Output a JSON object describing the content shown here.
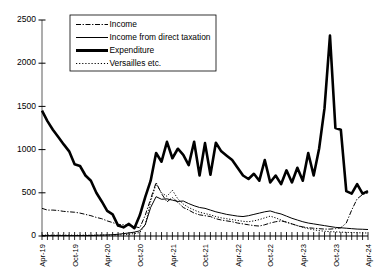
{
  "chart_data": {
    "type": "line",
    "title": "",
    "xlabel": "",
    "ylabel": "",
    "ylim": [
      0,
      2500
    ],
    "yticks": [
      0,
      500,
      1000,
      1500,
      2000,
      2500
    ],
    "ytick_labels": [
      "0",
      "500",
      "1000",
      "1500",
      "2000",
      "2500"
    ],
    "grid": false,
    "legend_position": "top-center",
    "x_axis_tick_count": 61,
    "x_label_interval": 6,
    "xtick_labels": [
      "Apr-19",
      "Oct-19",
      "Apr-20",
      "Oct-20",
      "Apr-21",
      "Oct-21",
      "Apr-22",
      "Oct-22",
      "Apr-23",
      "Oct-23",
      "Apr-24"
    ],
    "x": [
      "Apr-19",
      "May-19",
      "Jun-19",
      "Jul-19",
      "Aug-19",
      "Sep-19",
      "Oct-19",
      "Nov-19",
      "Dec-19",
      "Jan-20",
      "Feb-20",
      "Mar-20",
      "Apr-20",
      "May-20",
      "Jun-20",
      "Jul-20",
      "Aug-20",
      "Sep-20",
      "Oct-20",
      "Nov-20",
      "Dec-20",
      "Jan-21",
      "Feb-21",
      "Mar-21",
      "Apr-21",
      "May-21",
      "Jun-21",
      "Jul-21",
      "Aug-21",
      "Sep-21",
      "Oct-21",
      "Nov-21",
      "Dec-21",
      "Jan-22",
      "Feb-22",
      "Mar-22",
      "Apr-22",
      "May-22",
      "Jun-22",
      "Jul-22",
      "Aug-22",
      "Sep-22",
      "Oct-22",
      "Nov-22",
      "Dec-22",
      "Jan-23",
      "Feb-23",
      "Mar-23",
      "Apr-23",
      "May-23",
      "Jun-23",
      "Jul-23",
      "Aug-23",
      "Sep-23",
      "Oct-23",
      "Nov-23",
      "Dec-23",
      "Jan-24",
      "Feb-24",
      "Mar-24",
      "Apr-24"
    ],
    "series": [
      {
        "name": "Income",
        "style": "dash-dot",
        "color": "#000000",
        "values": [
          320,
          300,
          300,
          295,
          285,
          280,
          275,
          265,
          250,
          235,
          215,
          200,
          175,
          155,
          135,
          130,
          120,
          110,
          95,
          240,
          430,
          620,
          490,
          395,
          445,
          390,
          330,
          300,
          265,
          245,
          235,
          225,
          200,
          185,
          175,
          165,
          150,
          140,
          130,
          120,
          115,
          130,
          150,
          165,
          175,
          160,
          140,
          120,
          105,
          95,
          90,
          85,
          80,
          80,
          85,
          95,
          150,
          300,
          430,
          480,
          500
        ]
      },
      {
        "name": "Income from direct taxation",
        "style": "solid-thin",
        "color": "#000000",
        "values": [
          5,
          5,
          5,
          5,
          5,
          5,
          5,
          5,
          5,
          5,
          8,
          10,
          12,
          15,
          20,
          28,
          35,
          45,
          60,
          130,
          330,
          455,
          425,
          430,
          415,
          400,
          405,
          375,
          350,
          330,
          320,
          300,
          280,
          265,
          250,
          240,
          230,
          225,
          235,
          250,
          265,
          280,
          290,
          270,
          255,
          230,
          205,
          185,
          165,
          150,
          140,
          130,
          120,
          110,
          100,
          95,
          90,
          85,
          80,
          78,
          75
        ]
      },
      {
        "name": "Expenditure",
        "style": "solid-thick",
        "color": "#000000",
        "values": [
          1450,
          1330,
          1230,
          1145,
          1060,
          980,
          830,
          810,
          700,
          640,
          500,
          400,
          290,
          250,
          120,
          100,
          140,
          90,
          240,
          450,
          640,
          960,
          860,
          1090,
          900,
          1010,
          940,
          820,
          1090,
          700,
          1075,
          710,
          1080,
          980,
          930,
          880,
          790,
          700,
          660,
          720,
          640,
          880,
          620,
          700,
          600,
          760,
          620,
          790,
          640,
          960,
          700,
          1010,
          1480,
          2320,
          1250,
          1230,
          520,
          490,
          600,
          490,
          520
        ]
      },
      {
        "name": "Versailles etc.",
        "style": "dotted",
        "color": "#000000",
        "values": [
          10,
          10,
          10,
          10,
          10,
          10,
          10,
          10,
          10,
          10,
          10,
          10,
          10,
          10,
          12,
          15,
          20,
          28,
          40,
          130,
          400,
          600,
          500,
          460,
          530,
          430,
          370,
          330,
          300,
          275,
          260,
          245,
          225,
          210,
          200,
          190,
          180,
          170,
          165,
          175,
          190,
          210,
          230,
          210,
          185,
          160,
          140,
          120,
          100,
          85,
          72,
          62,
          55,
          50,
          48,
          45,
          42,
          40,
          38,
          36,
          35
        ]
      }
    ]
  },
  "legend": {
    "items": [
      {
        "label": "Income",
        "marker": "dash-dot-line-marker"
      },
      {
        "label": "Income from direct taxation",
        "marker": "thin-solid-line-marker"
      },
      {
        "label": "Expenditure",
        "marker": "thick-solid-line-marker"
      },
      {
        "label": "Versailles etc.",
        "marker": "dotted-line-marker"
      }
    ]
  }
}
